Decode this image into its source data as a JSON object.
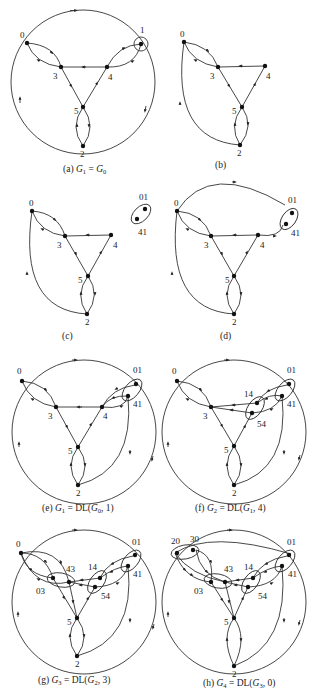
{
  "figure": {
    "panels": [
      {
        "id": "a",
        "caption": "(a) G₁ = G₀",
        "caption_parts": {
          "prefix": "(a) ",
          "lhs": "G",
          "lhs_sub": "1",
          "eq": " = ",
          "rhs": "G",
          "rhs_sub": "0"
        },
        "nodes": [
          "0",
          "1",
          "2",
          "3",
          "4",
          "5"
        ],
        "clusters": [
          [
            "1"
          ]
        ],
        "outer_circle": true
      },
      {
        "id": "b",
        "caption": "(b)",
        "nodes": [
          "0",
          "2",
          "3",
          "4",
          "5"
        ],
        "clusters": [],
        "outer_circle": false
      },
      {
        "id": "c",
        "caption": "(c)",
        "nodes": [
          "0",
          "2",
          "3",
          "4",
          "5",
          "01",
          "41"
        ],
        "clusters": [
          [
            "01",
            "41"
          ]
        ],
        "outer_circle": false
      },
      {
        "id": "d",
        "caption": "(d)",
        "nodes": [
          "0",
          "2",
          "3",
          "4",
          "5",
          "01",
          "41"
        ],
        "clusters": [
          [
            "01",
            "41"
          ]
        ],
        "outer_circle": false
      },
      {
        "id": "e",
        "caption": "(e) G₁ = DL(G₀, 1)",
        "caption_parts": {
          "prefix": "(e) ",
          "lhs": "G",
          "lhs_sub": "1",
          "eq": " = DL(",
          "rhs": "G",
          "rhs_sub": "0",
          "tail": ", 1)"
        },
        "nodes": [
          "0",
          "2",
          "3",
          "4",
          "5",
          "01",
          "41"
        ],
        "clusters": [
          [
            "01",
            "41"
          ]
        ],
        "outer_circle": true
      },
      {
        "id": "f",
        "caption": "(f) G₂ = DL(G₁, 4)",
        "caption_parts": {
          "prefix": "(f) ",
          "lhs": "G",
          "lhs_sub": "2",
          "eq": " = DL(",
          "rhs": "G",
          "rhs_sub": "1",
          "tail": ", 4)"
        },
        "nodes": [
          "0",
          "2",
          "3",
          "5",
          "01",
          "41",
          "14",
          "54"
        ],
        "clusters": [
          [
            "01",
            "41"
          ],
          [
            "14",
            "54"
          ]
        ],
        "outer_circle": true
      },
      {
        "id": "g",
        "caption": "(g) G₃ = DL(G₂, 3)",
        "caption_parts": {
          "prefix": "(g) ",
          "lhs": "G",
          "lhs_sub": "3",
          "eq": " = DL(",
          "rhs": "G",
          "rhs_sub": "2",
          "tail": ", 3)"
        },
        "nodes": [
          "0",
          "2",
          "5",
          "01",
          "41",
          "14",
          "54",
          "03",
          "43"
        ],
        "clusters": [
          [
            "01",
            "41"
          ],
          [
            "14",
            "54"
          ],
          [
            "03",
            "43"
          ]
        ],
        "outer_circle": true
      },
      {
        "id": "h",
        "caption": "(h) G₄ = DL(G₃, 0)",
        "caption_parts": {
          "prefix": "(h) ",
          "lhs": "G",
          "lhs_sub": "4",
          "eq": " = DL(",
          "rhs": "G",
          "rhs_sub": "3",
          "tail": ", 0)"
        },
        "nodes": [
          "2",
          "5",
          "01",
          "41",
          "14",
          "54",
          "03",
          "43",
          "20",
          "30"
        ],
        "clusters": [
          [
            "01",
            "41"
          ],
          [
            "14",
            "54"
          ],
          [
            "03",
            "43"
          ],
          [
            "20",
            "30"
          ]
        ],
        "outer_circle": true
      }
    ],
    "labels": {
      "n0": "0",
      "n1": "1",
      "n2": "2",
      "n3": "3",
      "n4": "4",
      "n5": "5",
      "n01": "01",
      "n41": "41",
      "n14": "14",
      "n54": "54",
      "n03": "03",
      "n43": "43",
      "n20": "20",
      "n30": "30"
    },
    "colors": {
      "stroke": "#333333",
      "node": "#111111",
      "background": "#ffffff"
    }
  }
}
